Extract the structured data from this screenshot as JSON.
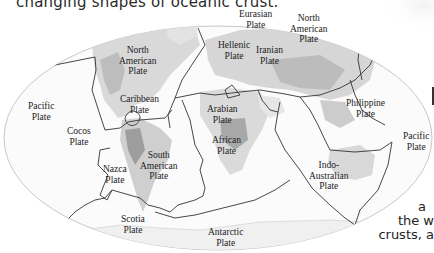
{
  "caption": {
    "top": "changing shapes of oceanic crust."
  },
  "map": {
    "title": "Tectonic plates world map",
    "labels": [
      {
        "id": "north-american-1",
        "lines": [
          "North",
          "American",
          "Plate"
        ]
      },
      {
        "id": "caribbean",
        "lines": [
          "Caribbean",
          "Plate"
        ]
      },
      {
        "id": "pacific-west",
        "lines": [
          "Pacific",
          "Plate"
        ]
      },
      {
        "id": "cocos",
        "lines": [
          "Cocos",
          "Plate"
        ]
      },
      {
        "id": "nazca",
        "lines": [
          "Nazca",
          "Plate"
        ]
      },
      {
        "id": "south-american",
        "lines": [
          "South",
          "American",
          "Plate"
        ]
      },
      {
        "id": "scotia",
        "lines": [
          "Scotia",
          "Plate"
        ]
      },
      {
        "id": "antarctic",
        "lines": [
          "Antarctic",
          "Plate"
        ]
      },
      {
        "id": "eurasian",
        "lines": [
          "Eurasian",
          "Plate"
        ]
      },
      {
        "id": "north-american-2",
        "lines": [
          "North",
          "American",
          "Plate"
        ]
      },
      {
        "id": "hellenic",
        "lines": [
          "Hellenic",
          "Plate"
        ]
      },
      {
        "id": "iranian",
        "lines": [
          "Iranian",
          "Plate"
        ]
      },
      {
        "id": "arabian",
        "lines": [
          "Arabian",
          "Plate"
        ]
      },
      {
        "id": "african",
        "lines": [
          "African",
          "Plate"
        ]
      },
      {
        "id": "philippine",
        "lines": [
          "Philippine",
          "Plate"
        ]
      },
      {
        "id": "pacific-east",
        "lines": [
          "Pacific",
          "Plate"
        ]
      },
      {
        "id": "indo-australian",
        "lines": [
          "Indo-",
          "Australian",
          "Plate"
        ]
      }
    ]
  },
  "side_text": {
    "line1": "a",
    "line2": "the w",
    "line3": "crusts, a"
  }
}
